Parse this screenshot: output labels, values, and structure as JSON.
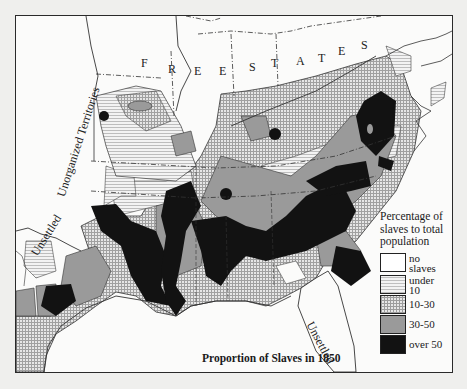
{
  "map": {
    "title": "Proportion of Slaves in 1850",
    "region_labels": {
      "free_states_letters": [
        "F",
        "R",
        "E",
        "E",
        "S",
        "T",
        "A",
        "T",
        "E",
        "S"
      ],
      "free_states": "FREE STATES",
      "unorganized_territories": "Unorganized Territories",
      "unsettled_west": "Unsettled",
      "unsettled_florida": "Unsettled"
    },
    "legend": {
      "heading": "Percentage of slaves to total population",
      "heading_lines": [
        "Percentage of",
        "slaves to total",
        "population"
      ],
      "items": [
        {
          "key": "none",
          "label_lines": [
            "no",
            "slaves"
          ],
          "fill": "#ffffff",
          "pattern": "blank"
        },
        {
          "key": "under10",
          "label_lines": [
            "under",
            "10"
          ],
          "fill": "#e6e6e6",
          "pattern": "horizontal-lines"
        },
        {
          "key": "10-30",
          "label_lines": [
            "10-30",
            ""
          ],
          "fill": "#cfcfcf",
          "pattern": "crosshatch"
        },
        {
          "key": "30-50",
          "label_lines": [
            "30-50",
            ""
          ],
          "fill": "#9a9a9a",
          "pattern": "solid-gray"
        },
        {
          "key": "over50",
          "label_lines": [
            "over 50",
            ""
          ],
          "fill": "#121212",
          "pattern": "solid-black"
        }
      ]
    },
    "colors": {
      "background": "#efefed",
      "map_paper": "#fbfbfa",
      "border": "#2a2a2a",
      "gray_30_50": "#9a9a9a",
      "black_over_50": "#121212"
    }
  }
}
